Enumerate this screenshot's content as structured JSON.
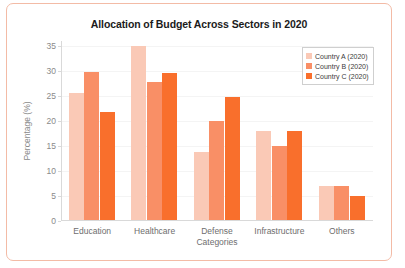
{
  "chart_data": {
    "type": "bar",
    "title": "Allocation of Budget Across Sectors in 2020",
    "xlabel": "Categories",
    "ylabel": "Percentage (%)",
    "categories": [
      "Education",
      "Healthcare",
      "Defense",
      "Infrastructure",
      "Others"
    ],
    "series": [
      {
        "name": "Country A (2020)",
        "color": "#fac9b6",
        "values": [
          25.7,
          35.0,
          13.9,
          18.0,
          7.0
        ]
      },
      {
        "name": "Country B (2020)",
        "color": "#f98f66",
        "values": [
          29.8,
          27.9,
          20.0,
          15.0,
          7.0
        ]
      },
      {
        "name": "Country C (2020)",
        "color": "#f96f2c",
        "values": [
          21.9,
          29.7,
          24.9,
          18.0,
          5.0
        ]
      }
    ],
    "ylim": [
      0,
      36
    ],
    "yticks": [
      0,
      5,
      10,
      15,
      20,
      25,
      30,
      35
    ],
    "grid": true,
    "legend_position": "upper right"
  },
  "frame": {
    "border_color": "#f3bba6"
  }
}
